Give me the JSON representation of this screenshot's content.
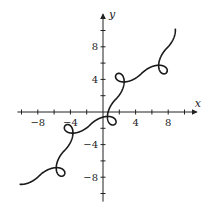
{
  "chart_data": {
    "type": "line",
    "title": "",
    "xlabel": "x",
    "ylabel": "y",
    "xlim": [
      -10.5,
      11.5
    ],
    "ylim": [
      -11,
      12
    ],
    "grid": false,
    "legend": null,
    "x_ticks": [
      -10,
      -8,
      -6,
      -4,
      -2,
      2,
      4,
      6,
      8,
      10
    ],
    "y_ticks": [
      -10,
      -8,
      -6,
      -4,
      -2,
      2,
      4,
      6,
      8,
      10
    ],
    "x_tick_labels": [
      {
        "value": -8,
        "label": "−8"
      },
      {
        "value": -4,
        "label": "−4"
      },
      {
        "value": 4,
        "label": "4"
      },
      {
        "value": 8,
        "label": "8"
      }
    ],
    "y_tick_labels": [
      {
        "value": 8,
        "label": "8"
      },
      {
        "value": 4,
        "label": "4"
      },
      {
        "value": -4,
        "label": "−4"
      },
      {
        "value": -8,
        "label": "−8"
      }
    ],
    "series": [
      {
        "name": "parametric curve",
        "description": "Curve along y = x with figure-eight loops centered near odd multiples of π/2",
        "t_range": [
          -8.6,
          8.6
        ],
        "loop_centers": [
          [
            -7.85,
            -7.85
          ],
          [
            -4.71,
            -4.71
          ],
          [
            -1.57,
            -1.57
          ],
          [
            1.57,
            1.57
          ],
          [
            4.71,
            4.71
          ],
          [
            7.85,
            7.85
          ]
        ],
        "color": "#1a1a1a"
      }
    ]
  }
}
